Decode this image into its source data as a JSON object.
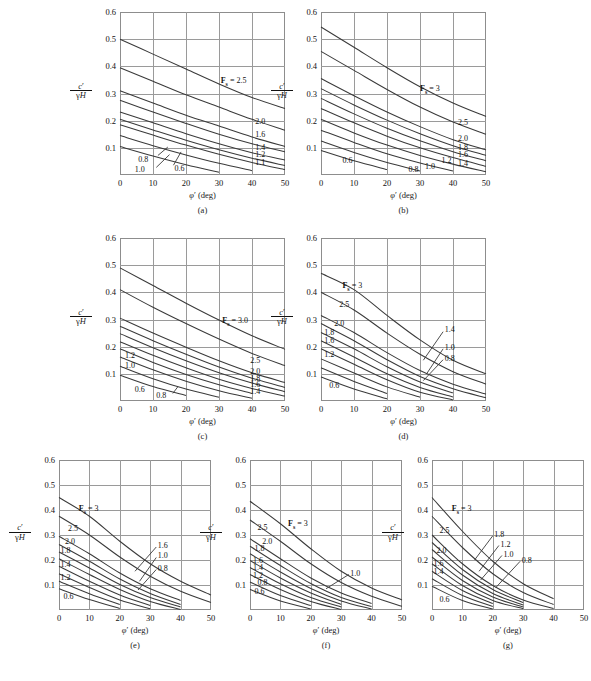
{
  "figure": {
    "axis": {
      "xlabel": "φ′ (deg)",
      "ylabel_num": "c′",
      "ylabel_den": "γH",
      "xticks": [
        "0",
        "10",
        "20",
        "30",
        "40",
        "50"
      ],
      "yticks": [
        "0.6",
        "0.5",
        "0.4",
        "0.3",
        "0.2",
        "0.1"
      ],
      "xrange": [
        0,
        50
      ],
      "yrange": [
        0,
        0.6
      ]
    },
    "panels": [
      {
        "id": "a",
        "caption": "(a)",
        "fs_tag": "F",
        "fs_sub": "s",
        "fs_value": "= 2.5",
        "labels_right": [
          "2.0",
          "1.6",
          "1.4",
          "1.2",
          "1.1"
        ],
        "labels_left": [
          "0.8",
          "1.0",
          "0.6"
        ]
      },
      {
        "id": "b",
        "caption": "(b)",
        "fs_tag": "F",
        "fs_sub": "s",
        "fs_value": "= 3",
        "labels_right": [
          "2.5",
          "2.0",
          "1.8",
          "1.6",
          "1.4",
          "1.2"
        ],
        "labels_left": [
          "0.6",
          "0.8",
          "1.0"
        ]
      },
      {
        "id": "c",
        "caption": "(c)",
        "fs_tag": "F",
        "fs_sub": "s",
        "fs_value": "= 3.0",
        "labels_right": [
          "2.5",
          "2.0",
          "1.8",
          "1.6",
          "1.4"
        ],
        "labels_left": [
          "1.2",
          "1.0",
          "0.6",
          "0.8"
        ]
      },
      {
        "id": "d",
        "caption": "(d)",
        "fs_tag": "F",
        "fs_sub": "s",
        "fs_value": "= 3",
        "labels_right": [
          "1.4",
          "1.0",
          "0.8"
        ],
        "labels_left": [
          "2.5",
          "2.0",
          "1.8",
          "1.6",
          "1.2",
          "0.6"
        ]
      },
      {
        "id": "e",
        "caption": "(e)",
        "fs_tag": "F",
        "fs_sub": "s",
        "fs_value": "= 3",
        "labels_right": [
          "1.6",
          "1.0",
          "0.8"
        ],
        "labels_left": [
          "2.5",
          "2.0",
          "1.8",
          "1.4",
          "1.2",
          "0.6"
        ]
      },
      {
        "id": "f",
        "caption": "(f)",
        "fs_tag": "F",
        "fs_sub": "s",
        "fs_value": "= 3",
        "labels_right": [
          "1.0"
        ],
        "labels_left": [
          "2.5",
          "2.0",
          "1.8",
          "1.6",
          "1.4",
          "1.2",
          "0.8",
          "0.6"
        ]
      },
      {
        "id": "g",
        "caption": "(g)",
        "fs_tag": "F",
        "fs_sub": "s",
        "fs_value": "= 3",
        "labels_right": [
          "1.8",
          "1.2",
          "1.0",
          "0.8"
        ],
        "labels_left": [
          "2.5",
          "2.0",
          "1.6",
          "1.4",
          "0.6"
        ]
      }
    ]
  },
  "chart_data": [
    {
      "type": "line",
      "panel": "a",
      "title": "(a)",
      "xlabel": "φ′ (deg)",
      "ylabel": "c′/γH",
      "xlim": [
        0,
        50
      ],
      "ylim": [
        0,
        0.6
      ],
      "grid": true,
      "legend": "inline curve labels (factor of safety F_s)",
      "x": [
        0,
        10,
        20,
        30,
        40,
        50
      ],
      "series": [
        {
          "name": "2.5",
          "values": [
            0.5,
            0.445,
            0.39,
            0.335,
            0.285,
            0.245
          ]
        },
        {
          "name": "2.0",
          "values": [
            0.395,
            0.345,
            0.295,
            0.25,
            0.205,
            0.165
          ]
        },
        {
          "name": "1.6",
          "values": [
            0.31,
            0.265,
            0.22,
            0.18,
            0.14,
            0.105
          ]
        },
        {
          "name": "1.4",
          "values": [
            0.275,
            0.232,
            0.19,
            0.15,
            0.115,
            0.085
          ]
        },
        {
          "name": "1.2",
          "values": [
            0.232,
            0.192,
            0.152,
            0.115,
            0.082,
            0.055
          ]
        },
        {
          "name": "1.1",
          "values": [
            0.205,
            0.166,
            0.128,
            0.093,
            0.062,
            0.035
          ]
        },
        {
          "name": "1.0",
          "values": [
            0.185,
            0.147,
            0.11,
            0.076,
            0.046,
            0.02
          ]
        },
        {
          "name": "0.8",
          "values": [
            0.145,
            0.108,
            0.074,
            0.043,
            0.016,
            null
          ]
        },
        {
          "name": "0.6",
          "values": [
            0.105,
            0.07,
            0.038,
            0.01,
            null,
            null
          ]
        }
      ]
    },
    {
      "type": "line",
      "panel": "b",
      "title": "(b)",
      "xlabel": "φ′ (deg)",
      "ylabel": "c′/γH",
      "xlim": [
        0,
        50
      ],
      "ylim": [
        0,
        0.6
      ],
      "grid": true,
      "x": [
        0,
        10,
        20,
        30,
        40,
        50
      ],
      "series": [
        {
          "name": "3",
          "values": [
            0.545,
            0.47,
            0.395,
            0.325,
            0.265,
            0.215
          ]
        },
        {
          "name": "2.5",
          "values": [
            0.455,
            0.385,
            0.315,
            0.25,
            0.195,
            0.15
          ]
        },
        {
          "name": "2.0",
          "values": [
            0.355,
            0.292,
            0.232,
            0.178,
            0.13,
            0.092
          ]
        },
        {
          "name": "1.8",
          "values": [
            0.318,
            0.258,
            0.202,
            0.152,
            0.108,
            0.072
          ]
        },
        {
          "name": "1.6",
          "values": [
            0.282,
            0.225,
            0.172,
            0.126,
            0.086,
            0.052
          ]
        },
        {
          "name": "1.4",
          "values": [
            0.245,
            0.192,
            0.143,
            0.1,
            0.064,
            0.032
          ]
        },
        {
          "name": "1.2",
          "values": [
            0.205,
            0.155,
            0.11,
            0.072,
            0.04,
            0.012
          ]
        },
        {
          "name": "1.0",
          "values": [
            0.165,
            0.12,
            0.078,
            0.044,
            0.015,
            null
          ]
        },
        {
          "name": "0.8",
          "values": [
            0.125,
            0.083,
            0.046,
            0.015,
            null,
            null
          ]
        },
        {
          "name": "0.6",
          "values": [
            0.09,
            0.052,
            0.02,
            null,
            null,
            null
          ]
        }
      ]
    },
    {
      "type": "line",
      "panel": "c",
      "title": "(c)",
      "xlabel": "φ′ (deg)",
      "ylabel": "c′/γH",
      "xlim": [
        0,
        50
      ],
      "ylim": [
        0,
        0.6
      ],
      "grid": true,
      "x": [
        0,
        10,
        20,
        30,
        40,
        50
      ],
      "series": [
        {
          "name": "3.0",
          "values": [
            0.49,
            0.425,
            0.36,
            0.298,
            0.24,
            0.19
          ]
        },
        {
          "name": "2.5",
          "values": [
            0.41,
            0.345,
            0.285,
            0.228,
            0.175,
            0.13
          ]
        },
        {
          "name": "2.0",
          "values": [
            0.305,
            0.25,
            0.198,
            0.148,
            0.104,
            0.068
          ]
        },
        {
          "name": "1.8",
          "values": [
            0.275,
            0.222,
            0.172,
            0.125,
            0.084,
            0.05
          ]
        },
        {
          "name": "1.6",
          "values": [
            0.248,
            0.196,
            0.148,
            0.104,
            0.066,
            0.034
          ]
        },
        {
          "name": "1.4",
          "values": [
            0.218,
            0.168,
            0.122,
            0.08,
            0.046,
            0.018
          ]
        },
        {
          "name": "1.2",
          "values": [
            0.192,
            0.142,
            0.098,
            0.06,
            0.028,
            null
          ]
        },
        {
          "name": "1.0",
          "values": [
            0.162,
            0.115,
            0.073,
            0.038,
            0.01,
            null
          ]
        },
        {
          "name": "0.8",
          "values": [
            0.128,
            0.082,
            0.044,
            0.014,
            null,
            null
          ]
        },
        {
          "name": "0.6",
          "values": [
            0.095,
            0.053,
            0.02,
            null,
            null,
            null
          ]
        }
      ]
    },
    {
      "type": "line",
      "panel": "d",
      "title": "(d)",
      "xlabel": "φ′ (deg)",
      "ylabel": "c′/γH",
      "xlim": [
        0,
        50
      ],
      "ylim": [
        0,
        0.6
      ],
      "grid": true,
      "x": [
        0,
        10,
        20,
        30,
        40,
        50
      ],
      "series": [
        {
          "name": "3",
          "values": [
            0.47,
            0.41,
            0.315,
            0.225,
            0.15,
            0.1
          ]
        },
        {
          "name": "2.5",
          "values": [
            0.4,
            0.335,
            0.25,
            0.172,
            0.108,
            0.062
          ]
        },
        {
          "name": "2.0",
          "values": [
            0.315,
            0.252,
            0.178,
            0.112,
            0.062,
            0.025
          ]
        },
        {
          "name": "1.8",
          "values": [
            0.285,
            0.222,
            0.152,
            0.09,
            0.045,
            0.012
          ]
        },
        {
          "name": "1.6",
          "values": [
            0.252,
            0.192,
            0.126,
            0.07,
            0.03,
            null
          ]
        },
        {
          "name": "1.4",
          "values": [
            0.222,
            0.162,
            0.1,
            0.05,
            0.015,
            null
          ]
        },
        {
          "name": "1.2",
          "values": [
            0.192,
            0.135,
            0.078,
            0.032,
            0.004,
            null
          ]
        },
        {
          "name": "1.0",
          "values": [
            0.155,
            0.103,
            0.052,
            0.014,
            null,
            null
          ]
        },
        {
          "name": "0.8",
          "values": [
            0.122,
            0.072,
            0.028,
            null,
            null,
            null
          ]
        },
        {
          "name": "0.6",
          "values": [
            0.088,
            0.044,
            0.008,
            null,
            null,
            null
          ]
        }
      ]
    },
    {
      "type": "line",
      "panel": "e",
      "title": "(e)",
      "xlabel": "φ′ (deg)",
      "ylabel": "c′/γH",
      "xlim": [
        0,
        50
      ],
      "ylim": [
        0,
        0.6
      ],
      "grid": true,
      "x": [
        0,
        10,
        20,
        30,
        40,
        50
      ],
      "series": [
        {
          "name": "3",
          "values": [
            0.45,
            0.375,
            0.275,
            0.185,
            0.115,
            0.06
          ]
        },
        {
          "name": "2.5",
          "values": [
            0.375,
            0.3,
            0.212,
            0.135,
            0.075,
            0.03
          ]
        },
        {
          "name": "2.0",
          "values": [
            0.295,
            0.225,
            0.148,
            0.085,
            0.038,
            null
          ]
        },
        {
          "name": "1.8",
          "values": [
            0.262,
            0.195,
            0.124,
            0.066,
            0.022,
            null
          ]
        },
        {
          "name": "1.6",
          "values": [
            0.232,
            0.168,
            0.102,
            0.05,
            0.012,
            null
          ]
        },
        {
          "name": "1.4",
          "values": [
            0.205,
            0.142,
            0.082,
            0.034,
            0.002,
            null
          ]
        },
        {
          "name": "1.2",
          "values": [
            0.175,
            0.115,
            0.06,
            0.018,
            null,
            null
          ]
        },
        {
          "name": "1.0",
          "values": [
            0.145,
            0.09,
            0.04,
            0.005,
            null,
            null
          ]
        },
        {
          "name": "0.8",
          "values": [
            0.115,
            0.065,
            0.022,
            null,
            null,
            null
          ]
        },
        {
          "name": "0.6",
          "values": [
            0.085,
            0.042,
            0.006,
            null,
            null,
            null
          ]
        }
      ]
    },
    {
      "type": "line",
      "panel": "f",
      "title": "(f)",
      "xlabel": "φ′ (deg)",
      "ylabel": "c′/γH",
      "xlim": [
        0,
        50
      ],
      "ylim": [
        0,
        0.6
      ],
      "grid": true,
      "x": [
        0,
        10,
        20,
        30,
        40,
        50
      ],
      "series": [
        {
          "name": "3",
          "values": [
            0.435,
            0.345,
            0.245,
            0.155,
            0.088,
            0.04
          ]
        },
        {
          "name": "2.5",
          "values": [
            0.36,
            0.275,
            0.185,
            0.11,
            0.055,
            0.015
          ]
        },
        {
          "name": "2.0",
          "values": [
            0.285,
            0.205,
            0.128,
            0.068,
            0.026,
            null
          ]
        },
        {
          "name": "1.8",
          "values": [
            0.255,
            0.178,
            0.106,
            0.05,
            0.014,
            null
          ]
        },
        {
          "name": "1.6",
          "values": [
            0.225,
            0.152,
            0.086,
            0.036,
            0.004,
            null
          ]
        },
        {
          "name": "1.4",
          "values": [
            0.198,
            0.128,
            0.068,
            0.022,
            null,
            null
          ]
        },
        {
          "name": "1.2",
          "values": [
            0.17,
            0.105,
            0.05,
            0.012,
            null,
            null
          ]
        },
        {
          "name": "1.0",
          "values": [
            0.142,
            0.082,
            0.034,
            0.002,
            null,
            null
          ]
        },
        {
          "name": "0.8",
          "values": [
            0.112,
            0.058,
            0.018,
            null,
            null,
            null
          ]
        },
        {
          "name": "0.6",
          "values": [
            0.082,
            0.036,
            0.004,
            null,
            null,
            null
          ]
        }
      ]
    },
    {
      "type": "line",
      "panel": "g",
      "title": "(g)",
      "xlabel": "φ′ (deg)",
      "ylabel": "c′/γH",
      "xlim": [
        0,
        50
      ],
      "ylim": [
        0,
        0.6
      ],
      "grid": true,
      "x": [
        0,
        10,
        20,
        30,
        40,
        50
      ],
      "series": [
        {
          "name": "3",
          "values": [
            0.45,
            0.315,
            0.195,
            0.105,
            0.045,
            null
          ]
        },
        {
          "name": "2.5",
          "values": [
            0.375,
            0.25,
            0.145,
            0.07,
            0.022,
            null
          ]
        },
        {
          "name": "2.0",
          "values": [
            0.3,
            0.185,
            0.098,
            0.04,
            0.006,
            null
          ]
        },
        {
          "name": "1.8",
          "values": [
            0.27,
            0.162,
            0.082,
            0.03,
            null,
            null
          ]
        },
        {
          "name": "1.6",
          "values": [
            0.242,
            0.14,
            0.066,
            0.02,
            null,
            null
          ]
        },
        {
          "name": "1.4",
          "values": [
            0.212,
            0.118,
            0.052,
            0.012,
            null,
            null
          ]
        },
        {
          "name": "1.2",
          "values": [
            0.185,
            0.098,
            0.038,
            0.005,
            null,
            null
          ]
        },
        {
          "name": "1.0",
          "values": [
            0.155,
            0.078,
            0.026,
            null,
            null,
            null
          ]
        },
        {
          "name": "0.8",
          "values": [
            0.125,
            0.058,
            0.014,
            null,
            null,
            null
          ]
        },
        {
          "name": "0.6",
          "values": [
            0.095,
            0.038,
            0.004,
            null,
            null,
            null
          ]
        }
      ]
    }
  ]
}
